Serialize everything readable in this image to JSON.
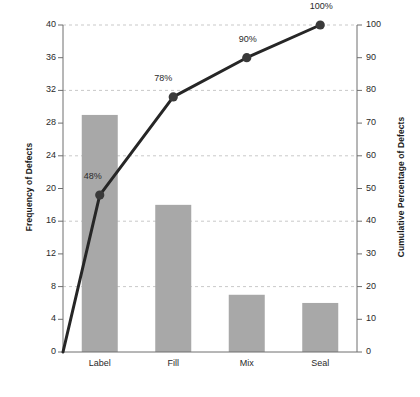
{
  "chart_data": {
    "type": "bar",
    "title": "",
    "subtitle": "",
    "xlabel": "",
    "ylabel": "Frequency of Defects",
    "y2label": "Cumulative Percentage of Defects",
    "categories": [
      "Label",
      "Fill",
      "Mix",
      "Seal"
    ],
    "values": [
      29,
      18,
      7,
      6
    ],
    "series": [
      {
        "name": "Frequency of Defects",
        "type": "bar",
        "axis": "left",
        "values": [
          29,
          18,
          7,
          6
        ]
      },
      {
        "name": "Cumulative Percentage of Defects",
        "type": "line",
        "axis": "right",
        "values": [
          48,
          78,
          90,
          100
        ],
        "point_labels": [
          "48%",
          "78%",
          "90%",
          "100%"
        ],
        "starts_at_origin": true
      }
    ],
    "ylim": [
      0,
      40
    ],
    "y2lim": [
      0,
      100
    ],
    "yticks": [
      0,
      4,
      8,
      12,
      16,
      20,
      24,
      28,
      32,
      36,
      40
    ],
    "ytick_labels": [
      "0",
      "4",
      "8",
      "12",
      "16",
      "20",
      "24",
      "28",
      "32",
      "36",
      "40"
    ],
    "y2ticks": [
      0,
      10,
      20,
      30,
      40,
      50,
      60,
      70,
      80,
      90,
      100
    ],
    "y2tick_labels": [
      "0",
      "10",
      "20",
      "30",
      "40",
      "50",
      "60",
      "70",
      "80",
      "90",
      "100"
    ],
    "gridlines": {
      "enabled": true,
      "at_left_values": [
        8,
        16,
        24,
        32,
        40
      ],
      "style": "dashed"
    },
    "legend": {
      "visible": false,
      "position": "none"
    },
    "colors": {
      "bar_fill": "#a8a8a8",
      "line": "#262626",
      "marker": "#3a3a3a",
      "axis": "#6e6e6e",
      "grid": "#c9c9c9",
      "text": "#2a2a2a",
      "background": "#ffffff"
    }
  },
  "axes": {
    "left_title": "Frequency of Defects",
    "right_title": "Cumulative Percentage of Defects"
  },
  "ticks": {
    "left": [
      {
        "value": 40,
        "label": "40"
      },
      {
        "value": 36,
        "label": "36"
      },
      {
        "value": 32,
        "label": "32"
      },
      {
        "value": 28,
        "label": "28"
      },
      {
        "value": 24,
        "label": "24"
      },
      {
        "value": 20,
        "label": "20"
      },
      {
        "value": 16,
        "label": "16"
      },
      {
        "value": 12,
        "label": "12"
      },
      {
        "value": 8,
        "label": "8"
      },
      {
        "value": 4,
        "label": "4"
      },
      {
        "value": 0,
        "label": "0"
      }
    ],
    "right": [
      {
        "value": 100,
        "label": "100"
      },
      {
        "value": 90,
        "label": "90"
      },
      {
        "value": 80,
        "label": "80"
      },
      {
        "value": 70,
        "label": "70"
      },
      {
        "value": 60,
        "label": "60"
      },
      {
        "value": 50,
        "label": "50"
      },
      {
        "value": 40,
        "label": "40"
      },
      {
        "value": 30,
        "label": "30"
      },
      {
        "value": 20,
        "label": "20"
      },
      {
        "value": 10,
        "label": "10"
      },
      {
        "value": 0,
        "label": "0"
      }
    ]
  },
  "categories": [
    {
      "label": "Label",
      "frequency": 29,
      "cumulative_pct": 48,
      "pct_label": "48%"
    },
    {
      "label": "Fill",
      "frequency": 18,
      "cumulative_pct": 78,
      "pct_label": "78%"
    },
    {
      "label": "Mix",
      "frequency": 7,
      "cumulative_pct": 90,
      "pct_label": "90%"
    },
    {
      "label": "Seal",
      "frequency": 6,
      "cumulative_pct": 100,
      "pct_label": "100%"
    }
  ]
}
